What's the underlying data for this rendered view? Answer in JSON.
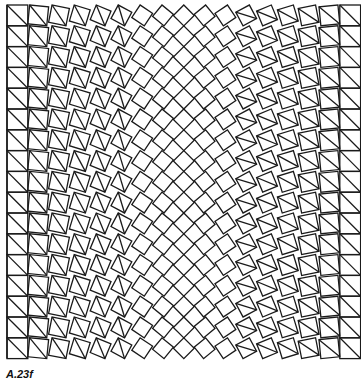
{
  "figure": {
    "caption": "A.23f",
    "grid": {
      "cols": 17,
      "rows": 17,
      "origin_x": 7,
      "origin_y": 5,
      "cell": 20.8
    },
    "stroke_color": "#1a1a1a",
    "background_color": "#ffffff"
  }
}
